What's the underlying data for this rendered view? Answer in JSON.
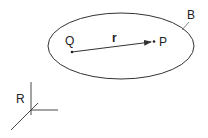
{
  "diagram": {
    "region_label": "B",
    "point_source_label": "Q",
    "point_field_label": "P",
    "vector_label": "r",
    "frame_label": "R",
    "colors": {
      "stroke": "#333333",
      "background": "#ffffff"
    }
  }
}
